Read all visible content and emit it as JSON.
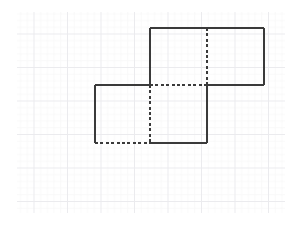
{
  "figure": {
    "title": "",
    "background_color": "#ffffff",
    "line_color": "#3a3a3a",
    "grid_color": "#f3f3f5",
    "grid_major_color": "#ececed",
    "line_width": 1.4,
    "dash_pattern": "3,2.4"
  },
  "grid": {
    "visible": true,
    "x_start": 17,
    "x_end": 285,
    "y_start": 12,
    "y_end": 213,
    "minor_spacing": 6.7,
    "major_spacing": 33.5,
    "minor_color": "#f6f6f7",
    "major_color": "#ebebee"
  },
  "chart_data": {
    "type": "diagram",
    "xlabel": "",
    "ylabel": "",
    "grid": true,
    "coordinate_note": "Pixel coordinates, origin top-left of 300x225 canvas",
    "squares": [
      {
        "name": "upper-right-square",
        "x": 150,
        "y": 28,
        "width": 114,
        "height": 57,
        "edges": [
          {
            "id": "upper-top",
            "from": [
              150,
              28
            ],
            "to": [
              264,
              28
            ],
            "style": "solid"
          },
          {
            "id": "upper-right",
            "from": [
              264,
              28
            ],
            "to": [
              264,
              85
            ],
            "style": "solid"
          },
          {
            "id": "upper-bottom-right",
            "from": [
              264,
              85
            ],
            "to": [
              207,
              85
            ],
            "style": "solid"
          },
          {
            "id": "upper-bottom-left",
            "from": [
              207,
              85
            ],
            "to": [
              150,
              85
            ],
            "style": "dashed"
          },
          {
            "id": "upper-left",
            "from": [
              150,
              85
            ],
            "to": [
              150,
              28
            ],
            "style": "solid"
          }
        ]
      },
      {
        "name": "lower-left-square",
        "x": 95,
        "y": 85,
        "width": 112,
        "height": 58,
        "edges": [
          {
            "id": "lower-top-left",
            "from": [
              95,
              85
            ],
            "to": [
              150,
              85
            ],
            "style": "solid"
          },
          {
            "id": "lower-left",
            "from": [
              95,
              85
            ],
            "to": [
              95,
              143
            ],
            "style": "solid"
          },
          {
            "id": "lower-bottom-left",
            "from": [
              95,
              143
            ],
            "to": [
              150,
              143
            ],
            "style": "dashed"
          },
          {
            "id": "lower-bottom-right",
            "from": [
              150,
              143
            ],
            "to": [
              207,
              143
            ],
            "style": "solid"
          },
          {
            "id": "lower-right",
            "from": [
              207,
              143
            ],
            "to": [
              207,
              85
            ],
            "style": "solid"
          }
        ]
      }
    ],
    "internal_lines": [
      {
        "id": "mid-vertical-upper",
        "from": [
          207,
          28
        ],
        "to": [
          207,
          85
        ],
        "style": "dashed"
      },
      {
        "id": "mid-vertical-lower",
        "from": [
          150,
          85
        ],
        "to": [
          150,
          143
        ],
        "style": "dashed"
      }
    ],
    "vertices": [
      {
        "id": "v-top-left",
        "x": 150,
        "y": 28
      },
      {
        "id": "v-top-mid",
        "x": 207,
        "y": 28
      },
      {
        "id": "v-top-right",
        "x": 264,
        "y": 28
      },
      {
        "id": "v-mid-left",
        "x": 95,
        "y": 85
      },
      {
        "id": "v-center-left",
        "x": 150,
        "y": 85
      },
      {
        "id": "v-center-right",
        "x": 207,
        "y": 85
      },
      {
        "id": "v-mid-right",
        "x": 264,
        "y": 85
      },
      {
        "id": "v-bottom-left",
        "x": 95,
        "y": 143
      },
      {
        "id": "v-bottom-mid",
        "x": 150,
        "y": 143
      },
      {
        "id": "v-bottom-right",
        "x": 207,
        "y": 143
      }
    ],
    "annotations": []
  }
}
